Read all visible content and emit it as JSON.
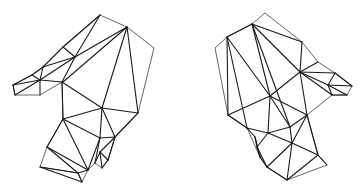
{
  "figure": {
    "stroke_color": "#1a1a1a",
    "outline_color": "#555555",
    "background": "#ffffff"
  },
  "meshes": [
    {
      "name": "left-hand",
      "outline": [
        [
          100,
          15
        ],
        [
          127,
          27
        ],
        [
          154,
          48
        ],
        [
          138,
          113
        ],
        [
          115,
          137
        ],
        [
          108,
          160
        ],
        [
          102,
          168
        ],
        [
          95,
          163
        ],
        [
          88,
          170
        ],
        [
          82,
          182
        ],
        [
          78,
          173
        ],
        [
          40,
          167
        ],
        [
          47,
          147
        ],
        [
          63,
          119
        ],
        [
          62,
          82
        ],
        [
          40,
          95
        ],
        [
          15,
          95
        ],
        [
          13,
          85
        ],
        [
          32,
          75
        ],
        [
          43,
          67
        ],
        [
          63,
          47
        ],
        [
          100,
          15
        ]
      ],
      "edges": [
        [
          [
            100,
            15
          ],
          [
            63,
            47
          ]
        ],
        [
          [
            100,
            15
          ],
          [
            75,
            57
          ]
        ],
        [
          [
            127,
            27
          ],
          [
            75,
            57
          ]
        ],
        [
          [
            127,
            27
          ],
          [
            63,
            82
          ]
        ],
        [
          [
            127,
            27
          ],
          [
            102,
            108
          ]
        ],
        [
          [
            127,
            27
          ],
          [
            138,
            113
          ]
        ],
        [
          [
            63,
            47
          ],
          [
            75,
            57
          ]
        ],
        [
          [
            63,
            47
          ],
          [
            43,
            67
          ]
        ],
        [
          [
            75,
            57
          ],
          [
            43,
            67
          ]
        ],
        [
          [
            75,
            57
          ],
          [
            40,
            80
          ]
        ],
        [
          [
            75,
            57
          ],
          [
            62,
            82
          ]
        ],
        [
          [
            43,
            67
          ],
          [
            40,
            80
          ]
        ],
        [
          [
            43,
            67
          ],
          [
            32,
            75
          ]
        ],
        [
          [
            32,
            75
          ],
          [
            40,
            80
          ]
        ],
        [
          [
            32,
            75
          ],
          [
            13,
            85
          ]
        ],
        [
          [
            40,
            80
          ],
          [
            13,
            85
          ]
        ],
        [
          [
            40,
            80
          ],
          [
            15,
            95
          ]
        ],
        [
          [
            40,
            80
          ],
          [
            40,
            95
          ]
        ],
        [
          [
            40,
            80
          ],
          [
            62,
            82
          ]
        ],
        [
          [
            13,
            85
          ],
          [
            15,
            95
          ]
        ],
        [
          [
            62,
            82
          ],
          [
            102,
            108
          ]
        ],
        [
          [
            62,
            82
          ],
          [
            63,
            119
          ]
        ],
        [
          [
            102,
            108
          ],
          [
            138,
            113
          ]
        ],
        [
          [
            102,
            108
          ],
          [
            63,
            119
          ]
        ],
        [
          [
            102,
            108
          ],
          [
            115,
            137
          ]
        ],
        [
          [
            102,
            108
          ],
          [
            100,
            138
          ]
        ],
        [
          [
            138,
            113
          ],
          [
            115,
            137
          ]
        ],
        [
          [
            63,
            119
          ],
          [
            100,
            138
          ]
        ],
        [
          [
            63,
            119
          ],
          [
            47,
            147
          ]
        ],
        [
          [
            63,
            119
          ],
          [
            88,
            170
          ]
        ],
        [
          [
            47,
            147
          ],
          [
            88,
            170
          ]
        ],
        [
          [
            47,
            147
          ],
          [
            78,
            173
          ]
        ],
        [
          [
            40,
            167
          ],
          [
            78,
            173
          ]
        ],
        [
          [
            40,
            167
          ],
          [
            82,
            182
          ]
        ],
        [
          [
            78,
            173
          ],
          [
            88,
            170
          ]
        ],
        [
          [
            78,
            173
          ],
          [
            82,
            182
          ]
        ],
        [
          [
            100,
            138
          ],
          [
            115,
            137
          ]
        ],
        [
          [
            100,
            138
          ],
          [
            95,
            163
          ]
        ],
        [
          [
            100,
            138
          ],
          [
            88,
            170
          ]
        ],
        [
          [
            115,
            137
          ],
          [
            108,
            160
          ]
        ],
        [
          [
            115,
            137
          ],
          [
            100,
            152
          ]
        ],
        [
          [
            100,
            152
          ],
          [
            108,
            160
          ]
        ],
        [
          [
            100,
            152
          ],
          [
            95,
            163
          ]
        ],
        [
          [
            100,
            152
          ],
          [
            102,
            168
          ]
        ],
        [
          [
            108,
            160
          ],
          [
            102,
            168
          ]
        ]
      ]
    },
    {
      "name": "right-hand",
      "outline": [
        [
          265,
          13
        ],
        [
          302,
          42
        ],
        [
          318,
          62
        ],
        [
          335,
          73
        ],
        [
          352,
          86
        ],
        [
          347,
          95
        ],
        [
          332,
          95
        ],
        [
          307,
          115
        ],
        [
          318,
          155
        ],
        [
          327,
          165
        ],
        [
          287,
          180
        ],
        [
          267,
          167
        ],
        [
          260,
          157
        ],
        [
          247,
          128
        ],
        [
          228,
          115
        ],
        [
          215,
          48
        ],
        [
          227,
          37
        ],
        [
          252,
          24
        ],
        [
          265,
          13
        ]
      ],
      "edges": [
        [
          [
            252,
            24
          ],
          [
            227,
            37
          ]
        ],
        [
          [
            252,
            24
          ],
          [
            302,
            42
          ]
        ],
        [
          [
            252,
            24
          ],
          [
            300,
            72
          ]
        ],
        [
          [
            252,
            24
          ],
          [
            270,
            96
          ]
        ],
        [
          [
            252,
            24
          ],
          [
            290,
            127
          ]
        ],
        [
          [
            227,
            37
          ],
          [
            270,
            96
          ]
        ],
        [
          [
            227,
            37
          ],
          [
            247,
            128
          ]
        ],
        [
          [
            227,
            37
          ],
          [
            228,
            115
          ]
        ],
        [
          [
            302,
            42
          ],
          [
            300,
            72
          ]
        ],
        [
          [
            300,
            72
          ],
          [
            318,
            62
          ]
        ],
        [
          [
            300,
            72
          ],
          [
            335,
            73
          ]
        ],
        [
          [
            300,
            72
          ],
          [
            328,
            85
          ]
        ],
        [
          [
            300,
            72
          ],
          [
            332,
            95
          ]
        ],
        [
          [
            300,
            72
          ],
          [
            270,
            96
          ]
        ],
        [
          [
            300,
            72
          ],
          [
            307,
            115
          ]
        ],
        [
          [
            335,
            73
          ],
          [
            328,
            85
          ]
        ],
        [
          [
            335,
            73
          ],
          [
            352,
            86
          ]
        ],
        [
          [
            328,
            85
          ],
          [
            352,
            86
          ]
        ],
        [
          [
            328,
            85
          ],
          [
            347,
            95
          ]
        ],
        [
          [
            328,
            85
          ],
          [
            332,
            95
          ]
        ],
        [
          [
            332,
            95
          ],
          [
            347,
            95
          ]
        ],
        [
          [
            270,
            96
          ],
          [
            228,
            115
          ]
        ],
        [
          [
            270,
            96
          ],
          [
            268,
            133
          ]
        ],
        [
          [
            270,
            96
          ],
          [
            290,
            127
          ]
        ],
        [
          [
            270,
            96
          ],
          [
            307,
            115
          ]
        ],
        [
          [
            228,
            115
          ],
          [
            247,
            128
          ]
        ],
        [
          [
            247,
            128
          ],
          [
            268,
            133
          ]
        ],
        [
          [
            247,
            128
          ],
          [
            255,
            137
          ]
        ],
        [
          [
            268,
            133
          ],
          [
            290,
            127
          ]
        ],
        [
          [
            268,
            133
          ],
          [
            292,
            143
          ]
        ],
        [
          [
            268,
            133
          ],
          [
            257,
            147
          ]
        ],
        [
          [
            290,
            127
          ],
          [
            307,
            115
          ]
        ],
        [
          [
            290,
            127
          ],
          [
            292,
            143
          ]
        ],
        [
          [
            307,
            115
          ],
          [
            292,
            143
          ]
        ],
        [
          [
            307,
            115
          ],
          [
            318,
            155
          ]
        ],
        [
          [
            292,
            143
          ],
          [
            318,
            155
          ]
        ],
        [
          [
            292,
            143
          ],
          [
            287,
            180
          ]
        ],
        [
          [
            292,
            143
          ],
          [
            267,
            167
          ]
        ],
        [
          [
            318,
            155
          ],
          [
            287,
            180
          ]
        ],
        [
          [
            318,
            155
          ],
          [
            327,
            165
          ]
        ],
        [
          [
            255,
            137
          ],
          [
            257,
            147
          ]
        ],
        [
          [
            255,
            137
          ],
          [
            260,
            157
          ]
        ],
        [
          [
            257,
            147
          ],
          [
            260,
            157
          ]
        ],
        [
          [
            257,
            147
          ],
          [
            267,
            167
          ]
        ],
        [
          [
            260,
            157
          ],
          [
            267,
            167
          ]
        ],
        [
          [
            267,
            167
          ],
          [
            287,
            180
          ]
        ]
      ]
    }
  ]
}
